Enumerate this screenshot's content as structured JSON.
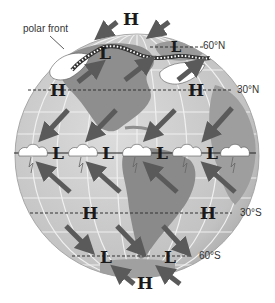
{
  "diagram": {
    "type": "global-pressure-belts-and-winds",
    "colors": {
      "ocean": "#c9c9c9",
      "land": "#8e8e8e",
      "land_light": "#b5b5b5",
      "grid": "#f2f2f2",
      "arrow": "#5a5a5a",
      "text": "#1a1a1a",
      "cloud": "#ffffff"
    },
    "annotations": {
      "polar_front": "polar front"
    },
    "latitude_labels": {
      "n60": "60°N",
      "n30": "30°N",
      "s30": "30°S",
      "s60": "60°S"
    },
    "pressure_systems": {
      "north_pole_high": "H",
      "n60_low_west": "L",
      "n60_low_east": "L",
      "n30_high_west": "H",
      "n30_high_east": "H",
      "eq_low_1": "L",
      "eq_low_2": "L",
      "eq_low_3": "L",
      "eq_low_4": "L",
      "s30_high_west": "H",
      "s30_high_east": "H",
      "s60_low_west": "L",
      "s60_low_east": "L",
      "south_pole_high": "H"
    }
  }
}
